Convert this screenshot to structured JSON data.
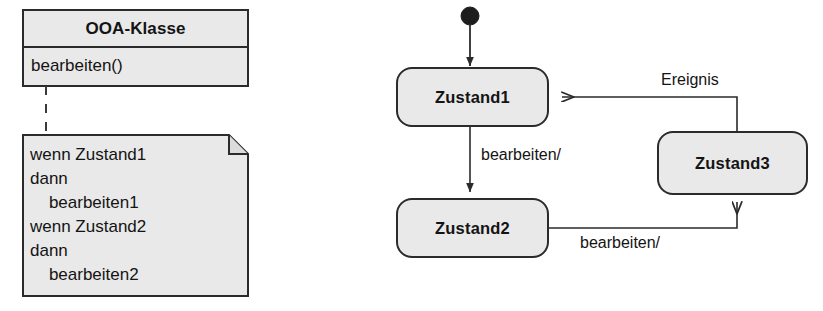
{
  "diagram": {
    "kind": "uml-class-and-state-diagram",
    "colors": {
      "fill": "#e9e9e9",
      "stroke": "#2b2b2b",
      "text": "#141414",
      "background": "#ffffff"
    }
  },
  "class_box": {
    "name_label": "OOA-Klasse",
    "operations": [
      "bearbeiten()"
    ]
  },
  "note_box": {
    "lines": [
      "wenn Zustand1",
      "dann",
      "    bearbeiten1",
      "wenn Zustand2",
      "dann",
      "    bearbeiten2"
    ],
    "connector": "dashed"
  },
  "state_machine": {
    "initial_node": "start-node",
    "states": [
      {
        "id": "zustand1",
        "label": "Zustand1"
      },
      {
        "id": "zustand2",
        "label": "Zustand2"
      },
      {
        "id": "zustand3",
        "label": "Zustand3"
      }
    ],
    "transitions": [
      {
        "id": "t-start-z1",
        "from": "start-node",
        "to": "zustand1",
        "label": ""
      },
      {
        "id": "t-z1-z2",
        "from": "zustand1",
        "to": "zustand2",
        "label": "bearbeiten/"
      },
      {
        "id": "t-z2-z3",
        "from": "zustand2",
        "to": "zustand3",
        "label": "bearbeiten/"
      },
      {
        "id": "t-z3-z1",
        "from": "zustand3",
        "to": "zustand1",
        "label": "Ereignis"
      }
    ]
  }
}
